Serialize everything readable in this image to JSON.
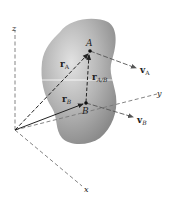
{
  "diagram": {
    "axes": {
      "x_label": "x",
      "y_label": "y",
      "z_label": "z"
    },
    "points": {
      "A": "A",
      "B": "B"
    },
    "vectors": {
      "rA": {
        "main": "r",
        "sub": "A"
      },
      "rB": {
        "main": "r",
        "sub": "B"
      },
      "rAB": {
        "main": "r",
        "sub": "A/B"
      },
      "vA": {
        "main": "v",
        "sub": "A"
      },
      "vB": {
        "main": "v",
        "sub": "B"
      }
    },
    "colors": {
      "body_fill": "#a8a8a8",
      "body_highlight": "#d9d9d9",
      "axis": "#777777",
      "vector": "#222222",
      "centerline": "#ffffff"
    }
  }
}
